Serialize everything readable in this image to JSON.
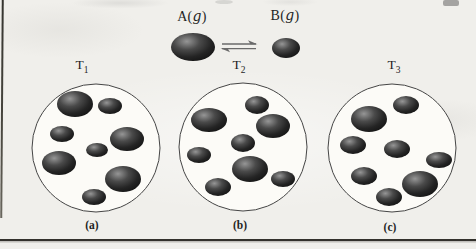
{
  "figure": {
    "legend": {
      "open_paren": "(",
      "close_paren": ")",
      "species": [
        {
          "name": "A",
          "state": "g"
        },
        {
          "name": "B",
          "state": "g"
        }
      ],
      "equilibrium_symbol": "⇌",
      "spheres": {
        "A": {
          "x": 193,
          "y": 47,
          "rx": 22,
          "ry": 14
        },
        "B": {
          "x": 286,
          "y": 48,
          "rx": 14,
          "ry": 10
        }
      }
    },
    "panels": [
      {
        "temperature_base": "T",
        "temperature_subscript": "1",
        "caption": "(a)",
        "circle": {
          "cx": 96,
          "cy": 148,
          "r": 64
        },
        "counts": {
          "A": 4,
          "B": 4
        },
        "molecules": [
          {
            "species": "A",
            "x": 75,
            "y": 104,
            "rx": 18,
            "ry": 13
          },
          {
            "species": "B",
            "x": 110,
            "y": 106,
            "rx": 12,
            "ry": 8
          },
          {
            "species": "B",
            "x": 62,
            "y": 134,
            "rx": 12,
            "ry": 8
          },
          {
            "species": "A",
            "x": 127,
            "y": 139,
            "rx": 17,
            "ry": 12
          },
          {
            "species": "B",
            "x": 97,
            "y": 150,
            "rx": 11,
            "ry": 7
          },
          {
            "species": "A",
            "x": 59,
            "y": 163,
            "rx": 17,
            "ry": 12
          },
          {
            "species": "A",
            "x": 123,
            "y": 179,
            "rx": 18,
            "ry": 13
          },
          {
            "species": "B",
            "x": 94,
            "y": 197,
            "rx": 12,
            "ry": 8
          }
        ]
      },
      {
        "temperature_base": "T",
        "temperature_subscript": "2",
        "caption": "(b)",
        "circle": {
          "cx": 243,
          "cy": 147,
          "r": 64
        },
        "counts": {
          "A": 3,
          "B": 5
        },
        "molecules": [
          {
            "species": "B",
            "x": 257,
            "y": 105,
            "rx": 12,
            "ry": 9
          },
          {
            "species": "A",
            "x": 209,
            "y": 120,
            "rx": 18,
            "ry": 12
          },
          {
            "species": "A",
            "x": 273,
            "y": 126,
            "rx": 17,
            "ry": 12
          },
          {
            "species": "B",
            "x": 243,
            "y": 143,
            "rx": 12,
            "ry": 9
          },
          {
            "species": "B",
            "x": 199,
            "y": 155,
            "rx": 12,
            "ry": 8
          },
          {
            "species": "A",
            "x": 250,
            "y": 169,
            "rx": 18,
            "ry": 13
          },
          {
            "species": "B",
            "x": 283,
            "y": 179,
            "rx": 12,
            "ry": 8
          },
          {
            "species": "B",
            "x": 218,
            "y": 187,
            "rx": 13,
            "ry": 9
          }
        ]
      },
      {
        "temperature_base": "T",
        "temperature_subscript": "3",
        "caption": "(c)",
        "circle": {
          "cx": 392,
          "cy": 148,
          "r": 64
        },
        "counts": {
          "A": 2,
          "B": 6
        },
        "molecules": [
          {
            "species": "B",
            "x": 406,
            "y": 105,
            "rx": 13,
            "ry": 9
          },
          {
            "species": "A",
            "x": 369,
            "y": 119,
            "rx": 18,
            "ry": 13
          },
          {
            "species": "B",
            "x": 353,
            "y": 145,
            "rx": 13,
            "ry": 9
          },
          {
            "species": "B",
            "x": 397,
            "y": 149,
            "rx": 13,
            "ry": 9
          },
          {
            "species": "B",
            "x": 439,
            "y": 160,
            "rx": 13,
            "ry": 8
          },
          {
            "species": "B",
            "x": 364,
            "y": 176,
            "rx": 13,
            "ry": 9
          },
          {
            "species": "A",
            "x": 420,
            "y": 184,
            "rx": 18,
            "ry": 13
          },
          {
            "species": "B",
            "x": 389,
            "y": 197,
            "rx": 13,
            "ry": 9
          }
        ]
      }
    ],
    "colors": {
      "paper": "#f0efeb",
      "circle_fill": "#fcfbf7",
      "circle_stroke": "#454545",
      "molecule_highlight": "#969696",
      "molecule_mid": "#3d3d3d",
      "molecule_dark": "#161616",
      "arrow": "#6a6a6a",
      "rule": "#33312c",
      "text": "#1f1f1f"
    }
  }
}
